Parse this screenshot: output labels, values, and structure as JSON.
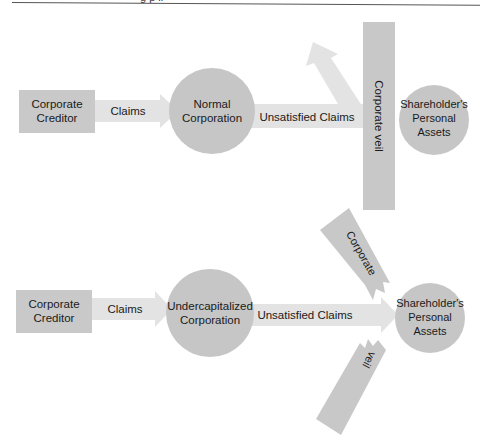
{
  "header": {
    "caption_fragment": "g    p         il"
  },
  "colors": {
    "box_fill": "#c9c9c9",
    "circle_fill": "#c6c6c6",
    "arrow_fill": "#e3e3e3",
    "veil_fill": "#c8c8c8",
    "text": "#1a1a1a",
    "background": "#ffffff"
  },
  "top_diagram": {
    "creditor": {
      "line1": "Corporate",
      "line2": "Creditor"
    },
    "claims_arrow": {
      "label": "Claims"
    },
    "corporation": {
      "line1": "Normal",
      "line2": "Corporation"
    },
    "unsatisfied_arrow": {
      "label": "Unsatisfied Claims"
    },
    "veil": {
      "label": "Corporate veil"
    },
    "shareholder": {
      "line1": "Shareholder's",
      "line2": "Personal",
      "line3": "Assets"
    }
  },
  "bottom_diagram": {
    "creditor": {
      "line1": "Corporate",
      "line2": "Creditor"
    },
    "claims_arrow": {
      "label": "Claims"
    },
    "corporation": {
      "line1": "Undercapitalized",
      "line2": "Corporation"
    },
    "unsatisfied_arrow": {
      "label": "Unsatisfied Claims"
    },
    "veil_upper": {
      "label": "Corporate"
    },
    "veil_lower": {
      "label": "veil"
    },
    "shareholder": {
      "line1": "Shareholder's",
      "line2": "Personal",
      "line3": "Assets"
    }
  }
}
